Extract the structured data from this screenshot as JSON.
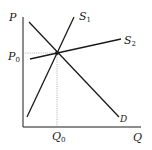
{
  "diagram": {
    "type": "supply-demand",
    "axes": {
      "y_label": "P",
      "x_label": "Q",
      "origin": [
        23,
        127
      ],
      "y_top": 17,
      "x_right": 141
    },
    "equilibrium": {
      "price_label": {
        "main": "P",
        "sub": "0"
      },
      "quantity_label": {
        "main": "Q",
        "sub": "0"
      },
      "point": [
        57,
        53
      ]
    },
    "curves": [
      {
        "id": "S1",
        "label": {
          "main": "S",
          "sub": "1"
        },
        "from": [
          27,
          117
        ],
        "to": [
          74,
          17
        ],
        "label_pos": [
          79,
          16
        ]
      },
      {
        "id": "S2",
        "label": {
          "main": "S",
          "sub": "2"
        },
        "from": [
          30,
          59
        ],
        "to": [
          121,
          39
        ],
        "label_pos": [
          124,
          44
        ]
      },
      {
        "id": "D",
        "label": {
          "main": "D",
          "sub": ""
        },
        "from": [
          29,
          22
        ],
        "to": [
          119,
          117
        ],
        "label_pos": [
          120,
          122
        ]
      }
    ],
    "colors": {
      "line": "#1a1a1a",
      "guide": "#999999",
      "background": "#ffffff"
    }
  }
}
